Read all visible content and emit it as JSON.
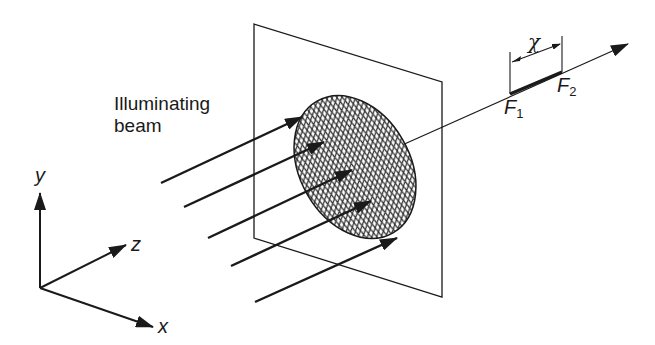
{
  "diagram": {
    "beam_label_line1": "Illuminating",
    "beam_label_line2": "beam",
    "axes": {
      "x": "x",
      "y": "y",
      "z": "z"
    },
    "focus": {
      "f1_main": "F",
      "f1_sub": "1",
      "f2_main": "F",
      "f2_sub": "2",
      "separation_symbol": "χ"
    },
    "colors": {
      "ink": "#1a1a1a",
      "background": "#ffffff",
      "hatch": "#333333"
    },
    "elements": [
      "plane (screen) in perspective",
      "hatched elliptical aperture/lens",
      "5 parallel beam arrows",
      "optical axis arrow",
      "focal segment F1-F2 with dimension χ",
      "xyz coordinate axes"
    ]
  }
}
